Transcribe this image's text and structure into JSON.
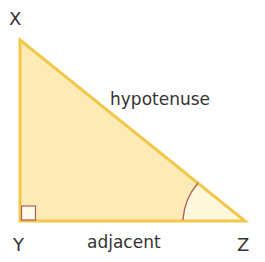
{
  "diagram": {
    "type": "right-triangle",
    "vertices": {
      "top": "X",
      "right_angle": "Y",
      "acute": "Z"
    },
    "sides": {
      "hypotenuse": "hypotenuse",
      "adjacent": "adjacent"
    },
    "colors": {
      "fill": "#fdebb5",
      "stroke": "#f2c84b",
      "angle_arc": "#b35c5c",
      "right_angle_marker": "#b35c5c",
      "text": "#333333"
    }
  }
}
